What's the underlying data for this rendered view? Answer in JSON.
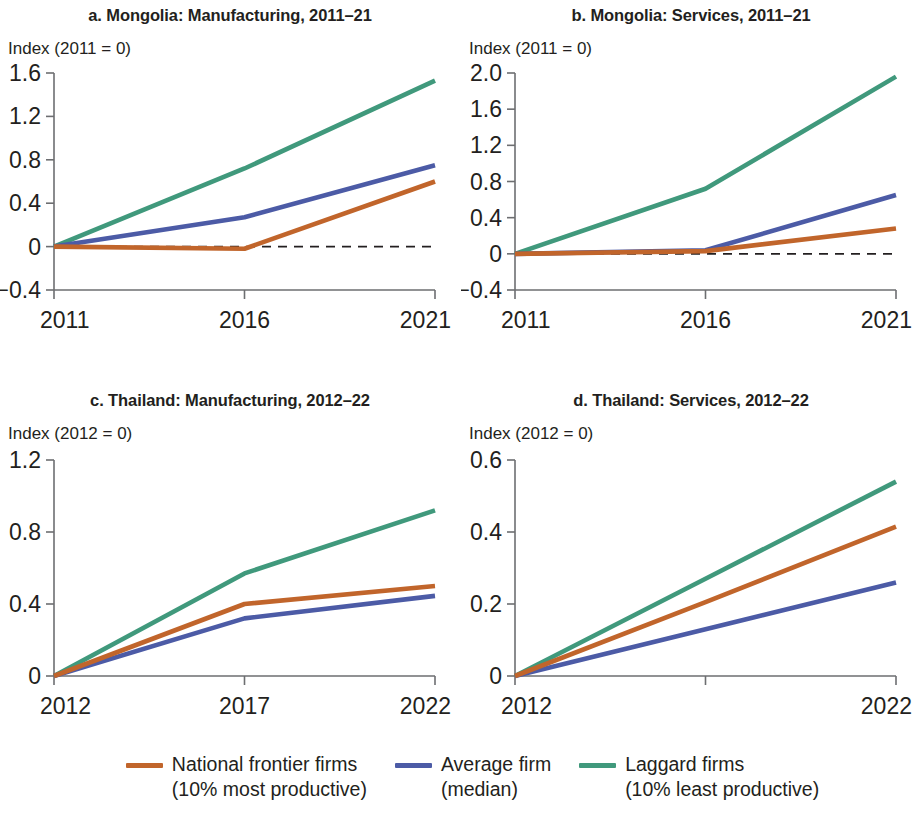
{
  "colors": {
    "frontier": "#C1652B",
    "average": "#4C5BA6",
    "laggard": "#40997C",
    "axis": "#6d6e71",
    "text": "#231f20"
  },
  "legend": {
    "items": [
      {
        "name": "frontier",
        "color": "#C1652B",
        "line1": "National frontier firms",
        "line2": "(10% most productive)"
      },
      {
        "name": "average",
        "color": "#4C5BA6",
        "line1": "Average firm",
        "line2": "(median)"
      },
      {
        "name": "laggard",
        "color": "#40997C",
        "line1": "Laggard firms",
        "line2": "(10% least productive)"
      }
    ]
  },
  "chart_data": [
    {
      "panel": "a",
      "type": "line",
      "title": "a. Mongolia: Manufacturing, 2011–21",
      "ylabel": "Index (2011 = 0)",
      "xlabel": "",
      "x": [
        2011,
        2016,
        2021
      ],
      "xtick_labels": [
        "2011",
        "2016",
        "2021"
      ],
      "ylim": [
        -0.4,
        1.6
      ],
      "ytick_values": [
        -0.4,
        0,
        0.4,
        0.8,
        1.2,
        1.6
      ],
      "ytick_labels": [
        "−0.4",
        "0",
        "0.4",
        "0.8",
        "1.2",
        "1.6"
      ],
      "grid": false,
      "zero_reference_line": true,
      "legend_position": "figure-bottom",
      "series": [
        {
          "name": "National frontier firms (10% most productive)",
          "color": "#C1652B",
          "values": [
            0,
            -0.02,
            0.6
          ]
        },
        {
          "name": "Average firm (median)",
          "color": "#4C5BA6",
          "values": [
            0,
            0.27,
            0.75
          ]
        },
        {
          "name": "Laggard firms (10% least productive)",
          "color": "#40997C",
          "values": [
            0,
            0.72,
            1.53
          ]
        }
      ]
    },
    {
      "panel": "b",
      "type": "line",
      "title": "b. Mongolia: Services, 2011–21",
      "ylabel": "Index (2011 = 0)",
      "xlabel": "",
      "x": [
        2011,
        2016,
        2021
      ],
      "xtick_labels": [
        "2011",
        "2016",
        "2021"
      ],
      "ylim": [
        -0.4,
        2.0
      ],
      "ytick_values": [
        -0.4,
        0,
        0.4,
        0.8,
        1.2,
        1.6,
        2.0
      ],
      "ytick_labels": [
        "−0.4",
        "0",
        "0.4",
        "0.8",
        "1.2",
        "1.6",
        "2.0"
      ],
      "grid": false,
      "zero_reference_line": true,
      "legend_position": "figure-bottom",
      "series": [
        {
          "name": "National frontier firms (10% most productive)",
          "color": "#C1652B",
          "values": [
            0,
            0.03,
            0.28
          ]
        },
        {
          "name": "Average firm (median)",
          "color": "#4C5BA6",
          "values": [
            0,
            0.04,
            0.65
          ]
        },
        {
          "name": "Laggard firms (10% least productive)",
          "color": "#40997C",
          "values": [
            0,
            0.72,
            1.96
          ]
        }
      ]
    },
    {
      "panel": "c",
      "type": "line",
      "title": "c. Thailand: Manufacturing, 2012–22",
      "ylabel": "Index (2012 = 0)",
      "xlabel": "",
      "x": [
        2012,
        2017,
        2022
      ],
      "xtick_labels": [
        "2012",
        "2017",
        "2022"
      ],
      "ylim": [
        0,
        1.2
      ],
      "ytick_values": [
        0,
        0.4,
        0.8,
        1.2
      ],
      "ytick_labels": [
        "0",
        "0.4",
        "0.8",
        "1.2"
      ],
      "grid": false,
      "zero_reference_line": false,
      "legend_position": "figure-bottom",
      "series": [
        {
          "name": "National frontier firms (10% most productive)",
          "color": "#C1652B",
          "values": [
            0,
            0.4,
            0.5
          ]
        },
        {
          "name": "Average firm (median)",
          "color": "#4C5BA6",
          "values": [
            0,
            0.32,
            0.445
          ]
        },
        {
          "name": "Laggard firms (10% least productive)",
          "color": "#40997C",
          "values": [
            0,
            0.57,
            0.92
          ]
        }
      ]
    },
    {
      "panel": "d",
      "type": "line",
      "title": "d. Thailand: Services, 2012–22",
      "ylabel": "Index (2012 = 0)",
      "xlabel": "",
      "x": [
        2012,
        2017,
        2022
      ],
      "xtick_labels": [
        "2012",
        "",
        "2022"
      ],
      "ylim": [
        0,
        0.6
      ],
      "ytick_values": [
        0,
        0.2,
        0.4,
        0.6
      ],
      "ytick_labels": [
        "0",
        "0.2",
        "0.4",
        "0.6"
      ],
      "grid": false,
      "zero_reference_line": false,
      "legend_position": "figure-bottom",
      "series": [
        {
          "name": "National frontier firms (10% most productive)",
          "color": "#C1652B",
          "values": [
            0,
            0.205,
            0.415
          ]
        },
        {
          "name": "Average firm (median)",
          "color": "#4C5BA6",
          "values": [
            0,
            0.13,
            0.26
          ]
        },
        {
          "name": "Laggard firms (10% least productive)",
          "color": "#40997C",
          "values": [
            0,
            0.27,
            0.54
          ]
        }
      ]
    }
  ]
}
